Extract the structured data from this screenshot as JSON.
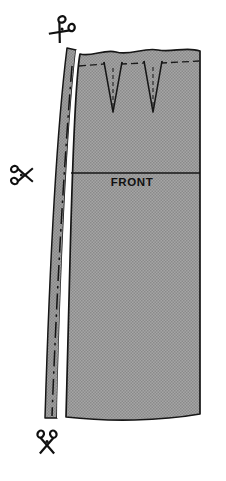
{
  "figure": {
    "kind": "sewing-pattern-diagram",
    "background_color": "#ffffff",
    "ink_color": "#161616"
  },
  "labels": {
    "front": "FRONT"
  },
  "pattern_piece": {
    "name": "front",
    "fill_color": "#9a9a9a",
    "fill_texture": "halftone-dots",
    "outline_color": "#161616",
    "outline_width_px": 1.6,
    "top_edge_style": "wavy",
    "bottom_edge_style": "gently-curved",
    "left_edge_style": "curved",
    "right_edge_style": "straight-vertical"
  },
  "seam_allowance_band": {
    "name": "left-seam-allowance",
    "fill_color": "#9a9a9a",
    "gap_color": "#ffffff",
    "position": "left-edge"
  },
  "fold_line": {
    "name": "center-fold-line",
    "style": "dash-dot",
    "color": "#111111",
    "orientation": "vertical"
  },
  "stitch_lines": {
    "name": "waist-stitching-line",
    "style": "dashed",
    "color": "#1a1a1a"
  },
  "horizontal_rule": {
    "name": "hip-line",
    "color": "#161616",
    "y_px": 173
  },
  "darts": [
    {
      "id": "dart-left",
      "apex_y_px": 112,
      "top_y_px": 62,
      "left_x_px": 104,
      "right_x_px": 122
    },
    {
      "id": "dart-right",
      "apex_y_px": 112,
      "top_y_px": 62,
      "left_x_px": 144,
      "right_x_px": 162
    }
  ],
  "scissors_markers": [
    {
      "id": "scissors-top",
      "icon": "scissors-icon",
      "rotation_deg": 130,
      "x_px": 63,
      "y_px": 28,
      "note": "cut at waist corner"
    },
    {
      "id": "scissors-middle",
      "icon": "scissors-icon",
      "rotation_deg": 0,
      "x_px": 27,
      "y_px": 175,
      "note": "cut at side seam"
    },
    {
      "id": "scissors-bottom",
      "icon": "scissors-icon",
      "rotation_deg": 90,
      "x_px": 47,
      "y_px": 452,
      "note": "cut at hem"
    }
  ]
}
